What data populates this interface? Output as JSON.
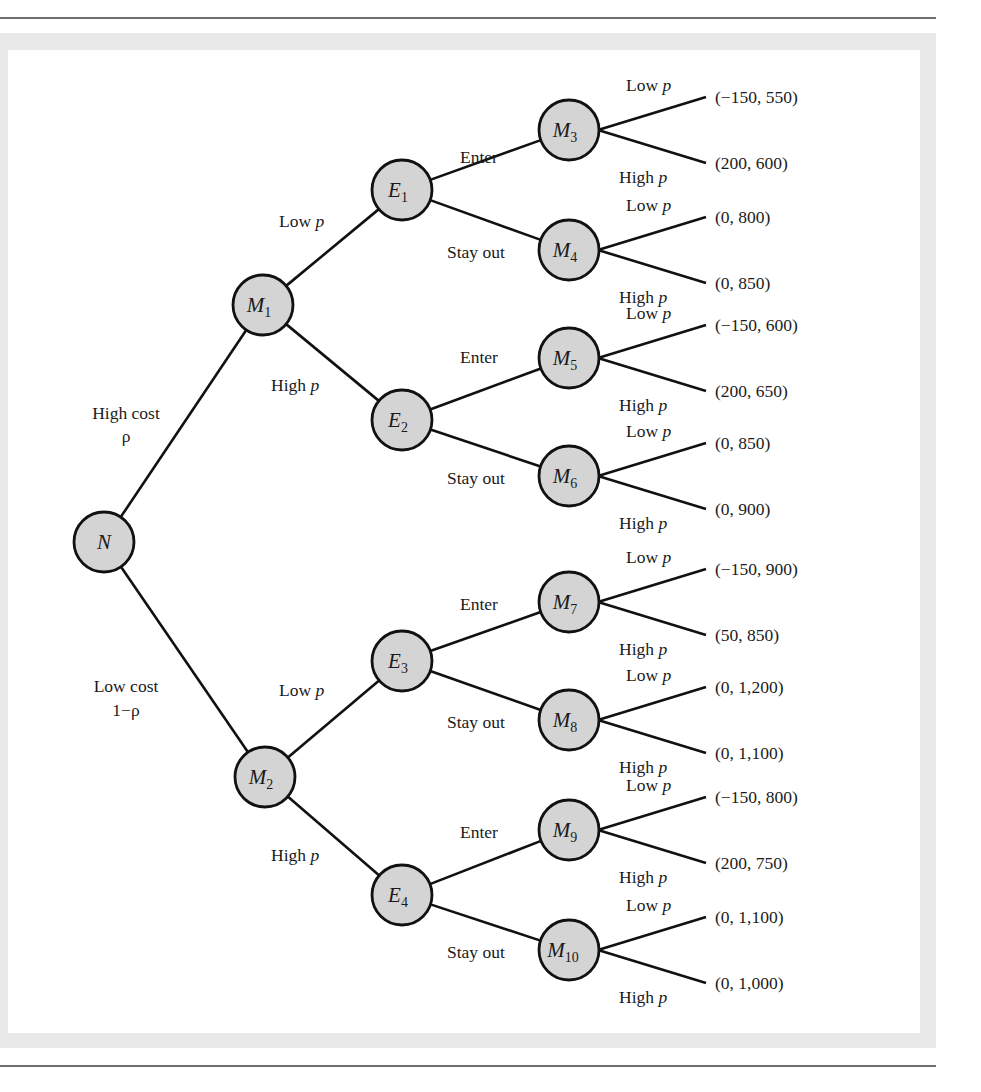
{
  "diagram": {
    "type": "game-tree",
    "colors": {
      "node_fill": "#d4d4d4",
      "node_stroke": "#111111",
      "edge": "#111111",
      "frame": "#e9e9e9",
      "rule": "#6e6e6e"
    },
    "root": {
      "id": "N",
      "label": "N",
      "sub": "",
      "x": 104,
      "y": 542
    },
    "nature_branches": [
      {
        "to": "M1",
        "label_line1": "High cost",
        "label_line2": "ρ",
        "lx": 126,
        "ly1": 419,
        "ly2": 442
      },
      {
        "to": "M2",
        "label_line1": "Low cost",
        "label_line2": "1−ρ",
        "lx": 126,
        "ly1": 692,
        "ly2": 716
      }
    ],
    "monopolist_nodes": [
      {
        "id": "M1",
        "label": "M",
        "sub": "1",
        "x": 263,
        "y": 305
      },
      {
        "id": "M2",
        "label": "M",
        "sub": "2",
        "x": 265,
        "y": 777
      }
    ],
    "price_branches": [
      {
        "from": "M1",
        "to": "E1",
        "word": "Low ",
        "p": "p",
        "lx": 279,
        "ly": 227
      },
      {
        "from": "M1",
        "to": "E2",
        "word": "High ",
        "p": "p",
        "lx": 271,
        "ly": 391
      },
      {
        "from": "M2",
        "to": "E3",
        "word": "Low ",
        "p": "p",
        "lx": 279,
        "ly": 696
      },
      {
        "from": "M2",
        "to": "E4",
        "word": "High ",
        "p": "p",
        "lx": 271,
        "ly": 861
      }
    ],
    "entrant_nodes": [
      {
        "id": "E1",
        "label": "E",
        "sub": "1",
        "x": 402,
        "y": 190
      },
      {
        "id": "E2",
        "label": "E",
        "sub": "2",
        "x": 402,
        "y": 420
      },
      {
        "id": "E3",
        "label": "E",
        "sub": "3",
        "x": 402,
        "y": 661
      },
      {
        "id": "E4",
        "label": "E",
        "sub": "4",
        "x": 402,
        "y": 895
      }
    ],
    "entry_branches": [
      {
        "from": "E1",
        "to": "M3",
        "label": "Enter",
        "lx": 460,
        "ly": 163
      },
      {
        "from": "E1",
        "to": "M4",
        "label": "Stay out",
        "lx": 447,
        "ly": 258
      },
      {
        "from": "E2",
        "to": "M5",
        "label": "Enter",
        "lx": 460,
        "ly": 363
      },
      {
        "from": "E2",
        "to": "M6",
        "label": "Stay out",
        "lx": 447,
        "ly": 484
      },
      {
        "from": "E3",
        "to": "M7",
        "label": "Enter",
        "lx": 460,
        "ly": 610
      },
      {
        "from": "E3",
        "to": "M8",
        "label": "Stay out",
        "lx": 447,
        "ly": 728
      },
      {
        "from": "E4",
        "to": "M9",
        "label": "Enter",
        "lx": 460,
        "ly": 838
      },
      {
        "from": "E4",
        "to": "M10",
        "label": "Stay out",
        "lx": 447,
        "ly": 958
      }
    ],
    "final_nodes": [
      {
        "id": "M3",
        "label": "M",
        "sub": "3",
        "x": 569,
        "y": 130,
        "low": {
          "word": "Low ",
          "p": "p",
          "payoff": "(−150, 550)"
        },
        "high": {
          "word": "High ",
          "p": "p",
          "payoff": "(200, 600)"
        }
      },
      {
        "id": "M4",
        "label": "M",
        "sub": "4",
        "x": 569,
        "y": 250,
        "low": {
          "word": "Low ",
          "p": "p",
          "payoff": "(0, 800)"
        },
        "high": {
          "word": "High ",
          "p": "p",
          "payoff": "(0, 850)"
        }
      },
      {
        "id": "M5",
        "label": "M",
        "sub": "5",
        "x": 569,
        "y": 358,
        "low": {
          "word": "Low ",
          "p": "p",
          "payoff": "(−150, 600)"
        },
        "high": {
          "word": "High ",
          "p": "p",
          "payoff": "(200, 650)"
        }
      },
      {
        "id": "M6",
        "label": "M",
        "sub": "6",
        "x": 569,
        "y": 476,
        "low": {
          "word": "Low ",
          "p": "p",
          "payoff": "(0, 850)"
        },
        "high": {
          "word": "High ",
          "p": "p",
          "payoff": "(0, 900)"
        }
      },
      {
        "id": "M7",
        "label": "M",
        "sub": "7",
        "x": 569,
        "y": 602,
        "low": {
          "word": "Low ",
          "p": "p",
          "payoff": "(−150, 900)"
        },
        "high": {
          "word": "High ",
          "p": "p",
          "payoff": "(50, 850)"
        }
      },
      {
        "id": "M8",
        "label": "M",
        "sub": "8",
        "x": 569,
        "y": 720,
        "low": {
          "word": "Low ",
          "p": "p",
          "payoff": "(0, 1,200)"
        },
        "high": {
          "word": "High ",
          "p": "p",
          "payoff": "(0, 1,100)"
        }
      },
      {
        "id": "M9",
        "label": "M",
        "sub": "9",
        "x": 569,
        "y": 830,
        "low": {
          "word": "Low ",
          "p": "p",
          "payoff": "(−150, 800)"
        },
        "high": {
          "word": "High ",
          "p": "p",
          "payoff": "(200, 750)"
        }
      },
      {
        "id": "M10",
        "label": "M",
        "sub": "10",
        "x": 569,
        "y": 950,
        "low": {
          "word": "Low ",
          "p": "p",
          "payoff": "(0, 1,100)"
        },
        "high": {
          "word": "High ",
          "p": "p",
          "payoff": "(0, 1,000)"
        }
      }
    ]
  }
}
